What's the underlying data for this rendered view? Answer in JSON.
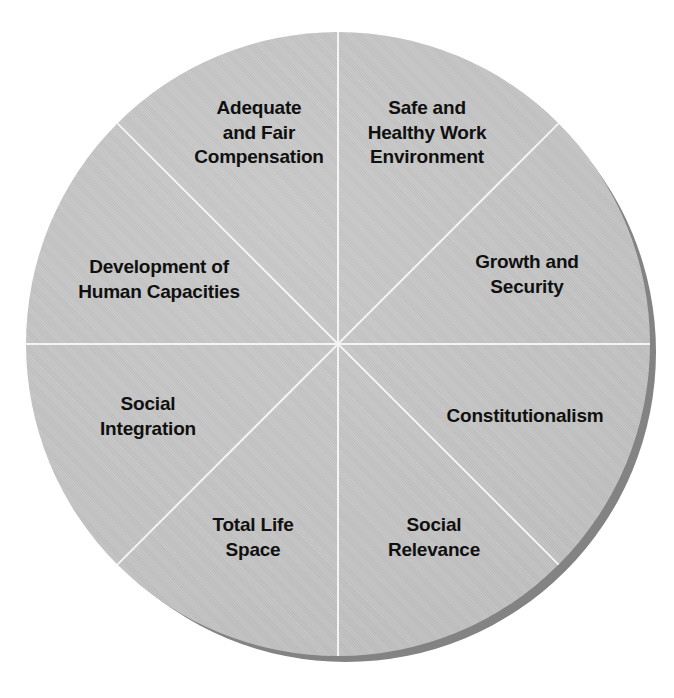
{
  "diagram": {
    "type": "wheel",
    "title": "",
    "segment_count": 8,
    "geometry": {
      "center_x": 338,
      "center_y": 344,
      "radius": 312,
      "segment_angle_degrees": 45
    },
    "colors": {
      "background": "#ffffff",
      "segment_fill": "#c4c4c4",
      "divider": "#f4f4f4",
      "shadow": "#838383",
      "label_text": "#101010"
    },
    "segments": [
      {
        "id": "safe-healthy-work-environment",
        "label": "Safe and\nHealthy Work\nEnvironment",
        "position": "top-right-upper",
        "start_angle_degrees": 0,
        "end_angle_degrees": 45
      },
      {
        "id": "growth-security",
        "label": "Growth and\nSecurity",
        "position": "right-upper",
        "start_angle_degrees": 45,
        "end_angle_degrees": 90
      },
      {
        "id": "constitutionalism",
        "label": "Constitutionalism",
        "position": "right-lower",
        "start_angle_degrees": 90,
        "end_angle_degrees": 135
      },
      {
        "id": "social-relevance",
        "label": "Social\nRelevance",
        "position": "bottom-right",
        "start_angle_degrees": 135,
        "end_angle_degrees": 180
      },
      {
        "id": "total-life-space",
        "label": "Total Life\nSpace",
        "position": "bottom-left",
        "start_angle_degrees": 180,
        "end_angle_degrees": 225
      },
      {
        "id": "social-integration",
        "label": "Social\nIntegration",
        "position": "left-lower",
        "start_angle_degrees": 225,
        "end_angle_degrees": 270
      },
      {
        "id": "development-human-capacities",
        "label": "Development of\nHuman Capacities",
        "position": "left-upper",
        "start_angle_degrees": 270,
        "end_angle_degrees": 315
      },
      {
        "id": "adequate-fair-compensation",
        "label": "Adequate\nand Fair\nCompensation",
        "position": "top-left-upper",
        "start_angle_degrees": 315,
        "end_angle_degrees": 360
      }
    ]
  }
}
